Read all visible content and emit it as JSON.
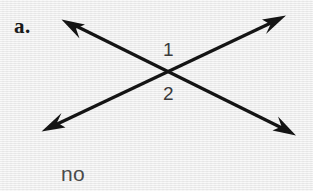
{
  "figure": {
    "part_label": "a.",
    "answer": "no",
    "background_color": "#ededed",
    "stroke_color": "#141414",
    "label_color": "#3a3a3a",
    "angle_labels": [
      {
        "id": "angle-1",
        "text": "1",
        "position": "above-intersection"
      },
      {
        "id": "angle-2",
        "text": "2",
        "position": "below-intersection"
      }
    ],
    "intersection": {
      "x": 172,
      "y": 73
    },
    "lines": [
      {
        "id": "line-nw-se",
        "from": {
          "x": 62,
          "y": 20
        },
        "to": {
          "x": 295,
          "y": 135
        },
        "arrowheads": "both"
      },
      {
        "id": "line-sw-ne",
        "from": {
          "x": 42,
          "y": 131
        },
        "to": {
          "x": 285,
          "y": 16
        },
        "arrowheads": "both"
      }
    ]
  }
}
